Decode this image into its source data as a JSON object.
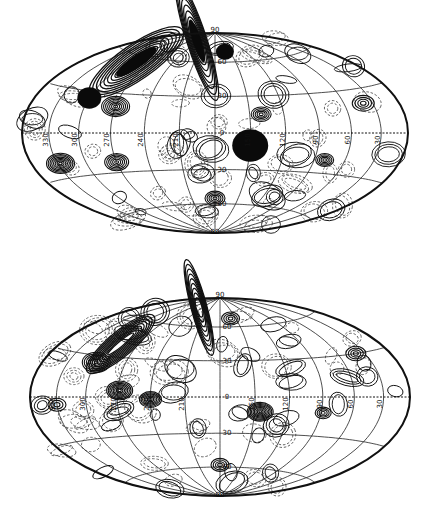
{
  "figure": {
    "panels": [
      {
        "id": "top",
        "projection": "hammer-aitoff",
        "center": [
          215,
          133
        ],
        "radius_x": 193,
        "radius_y": 100,
        "pole_labels": {
          "north": "90",
          "south": "90"
        },
        "lat_labels": [
          "60",
          "30",
          "0",
          "30",
          "60"
        ],
        "lon_labels": [
          "330",
          "300",
          "270",
          "240",
          "210",
          "180",
          "150",
          "120",
          "90",
          "60",
          "30"
        ],
        "features": {
          "dense_bands": [
            {
              "lon": 290,
              "lat": 55,
              "rx": 0.07,
              "ry": 0.28,
              "rot": -35,
              "solid": true
            },
            {
              "lon": 250,
              "lat": 80,
              "rx": 0.25,
              "ry": 0.05,
              "rot": -18,
              "solid": true
            }
          ],
          "solid_spots": [
            {
              "lon": 150,
              "lat": -10,
              "r": 18
            },
            {
              "lon": 300,
              "lat": 25,
              "r": 12
            },
            {
              "lon": 160,
              "lat": 70,
              "r": 9
            }
          ],
          "ring_spots": [
            {
              "lon": 270,
              "lat": 20,
              "r": 14,
              "rings": 7
            },
            {
              "lon": 327,
              "lat": -20,
              "r": 14,
              "rings": 8
            },
            {
              "lon": 270,
              "lat": -22,
              "r": 12,
              "rings": 6
            },
            {
              "lon": 140,
              "lat": 15,
              "r": 10,
              "rings": 5
            },
            {
              "lon": 40,
              "lat": 20,
              "r": 11,
              "rings": 4
            },
            {
              "lon": 80,
              "lat": -20,
              "r": 9,
              "rings": 5
            },
            {
              "lon": 180,
              "lat": -55,
              "r": 10,
              "rings": 5
            }
          ]
        }
      },
      {
        "id": "bottom",
        "projection": "hammer-aitoff",
        "center": [
          220,
          397
        ],
        "radius_x": 190,
        "radius_y": 99,
        "pole_labels": {
          "north": "90",
          "south": "90"
        },
        "lat_labels": [
          "60",
          "30",
          "0",
          "30",
          "60"
        ],
        "lon_labels": [
          "330",
          "300",
          "270",
          "240",
          "210",
          "180",
          "150",
          "120",
          "90",
          "60",
          "30"
        ],
        "features": {
          "dense_bands": [
            {
              "lon": 290,
              "lat": 40,
              "rx": 0.05,
              "ry": 0.22,
              "rot": -40,
              "solid": false
            },
            {
              "lon": 250,
              "lat": 78,
              "rx": 0.2,
              "ry": 0.04,
              "rot": -15,
              "solid": false
            }
          ],
          "solid_spots": [],
          "ring_spots": [
            {
              "lon": 300,
              "lat": 25,
              "r": 14,
              "rings": 7
            },
            {
              "lon": 268,
              "lat": 5,
              "r": 13,
              "rings": 8
            },
            {
              "lon": 240,
              "lat": -2,
              "r": 11,
              "rings": 7
            },
            {
              "lon": 145,
              "lat": -12,
              "r": 13,
              "rings": 9
            },
            {
              "lon": 88,
              "lat": -12,
              "r": 8,
              "rings": 4
            },
            {
              "lon": 40,
              "lat": 30,
              "r": 10,
              "rings": 4
            },
            {
              "lon": 180,
              "lat": -58,
              "r": 9,
              "rings": 4
            },
            {
              "lon": 160,
              "lat": 68,
              "r": 9,
              "rings": 4
            },
            {
              "lon": 330,
              "lat": -5,
              "r": 9,
              "rings": 3
            }
          ]
        }
      }
    ]
  }
}
